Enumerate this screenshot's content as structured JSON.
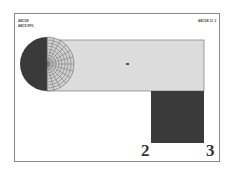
{
  "header": {
    "title_line1": "ABCDE",
    "title_line2": "ABCD EFG",
    "right_label": "ABCDE 12_3"
  },
  "diagram": {
    "colors": {
      "frame": "#888888",
      "light_fill": "#dcdcdc",
      "dark_fill": "#3a3a3a",
      "grid": "#555555"
    },
    "corner_labels": [
      "2",
      "3"
    ]
  }
}
